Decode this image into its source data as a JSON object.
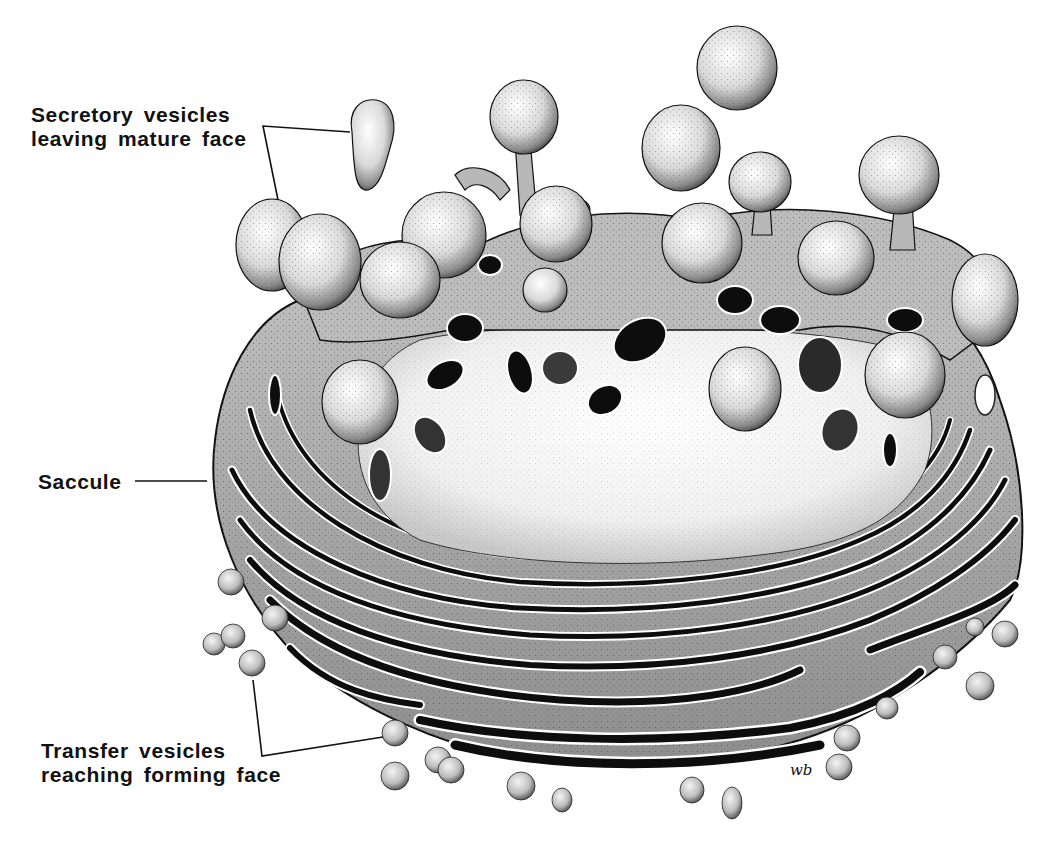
{
  "figure": {
    "background_color": "#ffffff",
    "ink_color": "#111111",
    "artist_signature": "wb"
  },
  "labels": {
    "secretory": {
      "line1": "Secretory vesicles",
      "line2": "leaving mature face"
    },
    "saccule": {
      "text": "Saccule"
    },
    "transfer": {
      "line1": "Transfer vesicles",
      "line2": "reaching forming face"
    }
  },
  "caption": {
    "text": "",
    "note": "faint illegible bleed-through text at bottom edge"
  }
}
